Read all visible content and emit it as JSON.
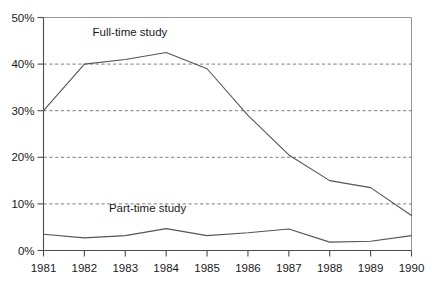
{
  "chart_data": {
    "type": "line",
    "title": "",
    "subtitle": "",
    "xlabel": "",
    "ylabel": "",
    "x": [
      1981,
      1982,
      1983,
      1984,
      1985,
      1986,
      1987,
      1988,
      1989,
      1990
    ],
    "xtick_labels": [
      "1981",
      "1982",
      "1983",
      "1984",
      "1985",
      "1986",
      "1987",
      "1988",
      "1989",
      "1990"
    ],
    "ytick_labels": [
      "0%",
      "10%",
      "20%",
      "30%",
      "40%",
      "50%"
    ],
    "ytick_values": [
      0,
      10,
      20,
      30,
      40,
      50
    ],
    "ylim": [
      0,
      50
    ],
    "xlim": [
      1981,
      1990
    ],
    "grid": "horizontal-dashed",
    "legend_position": "inline-annotations",
    "series": [
      {
        "name": "Full-time study",
        "label": "Full-time study",
        "color": "#555555",
        "values": [
          30,
          40,
          41,
          42.5,
          39,
          29,
          20.5,
          15,
          13.5,
          7.5
        ]
      },
      {
        "name": "Part-time study",
        "label": "Part-time study",
        "color": "#555555",
        "values": [
          3.5,
          2.7,
          3.2,
          4.7,
          3.2,
          3.8,
          4.6,
          1.8,
          2.0,
          3.2
        ]
      }
    ],
    "annotations": [
      {
        "text": "Full-time study",
        "x": 1982.2,
        "y": 46.0
      },
      {
        "text": "Part-time study",
        "x": 1982.6,
        "y": 8.2
      }
    ]
  },
  "colors": {
    "background": "#ffffff",
    "axis": "#4d4d4d",
    "grid": "#6e6e6e",
    "frame": "#8a8a8a",
    "text": "#1a1a1a",
    "line": "#555555"
  }
}
